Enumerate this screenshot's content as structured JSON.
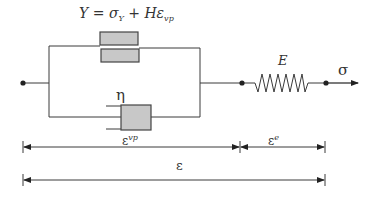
{
  "diagram": {
    "type": "rheological-model",
    "yield_label": {
      "Y": "Y",
      "eq": " = ",
      "sigma": "σ",
      "sigma_sub": "Y",
      "plus": " + ",
      "H": "H",
      "eps": "ε",
      "eps_sub": "vp"
    },
    "viscosity_label": "η",
    "spring_label": "E",
    "stress_label": "σ",
    "strain_vp": {
      "base": "ε",
      "sup": "vp"
    },
    "strain_e": {
      "base": "ε",
      "sup": "e"
    },
    "strain_total": "ε",
    "colors": {
      "line": "#3a3a3a",
      "block_fill": "#c8c8c8",
      "block_stroke": "#444444",
      "text": "#333333"
    }
  }
}
